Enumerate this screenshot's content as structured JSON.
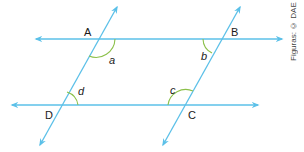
{
  "figure": {
    "type": "parallelogram formed by two pairs of parallel lines",
    "line_color": "#5bc0e8",
    "arc_color": "#8cc04a",
    "points": [
      {
        "label": "A",
        "x": 96,
        "y": 39
      },
      {
        "label": "B",
        "x": 220,
        "y": 39
      },
      {
        "label": "C",
        "x": 185,
        "y": 105
      },
      {
        "label": "D",
        "x": 60,
        "y": 105
      }
    ],
    "angles": [
      {
        "label": "a",
        "vertex": "A"
      },
      {
        "label": "b",
        "vertex": "B"
      },
      {
        "label": "c",
        "vertex": "C"
      },
      {
        "label": "d",
        "vertex": "D"
      }
    ],
    "credit": "Figuras: © DAE"
  }
}
